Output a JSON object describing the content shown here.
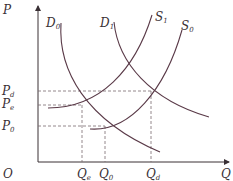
{
  "diagram": {
    "type": "supply-demand",
    "axes": {
      "y_label": {
        "main": "P",
        "sub": ""
      },
      "x_label": {
        "main": "Q",
        "sub": ""
      },
      "origin_label": "O"
    },
    "price_labels": [
      {
        "main": "P",
        "sub": "d"
      },
      {
        "main": "P",
        "sub": "e"
      },
      {
        "main": "P",
        "sub": "0"
      }
    ],
    "quantity_labels": [
      {
        "main": "Q",
        "sub": "e"
      },
      {
        "main": "Q",
        "sub": "0"
      },
      {
        "main": "Q",
        "sub": "d"
      }
    ],
    "curves": [
      {
        "main": "D",
        "sub": "0",
        "kind": "demand"
      },
      {
        "main": "D",
        "sub": "1",
        "kind": "demand"
      },
      {
        "main": "S",
        "sub": "1",
        "kind": "supply"
      },
      {
        "main": "S",
        "sub": "0",
        "kind": "supply"
      }
    ],
    "colors": {
      "curve": "#5a3a48",
      "axis": "#3a3035",
      "dash": "#7a6a70"
    }
  }
}
